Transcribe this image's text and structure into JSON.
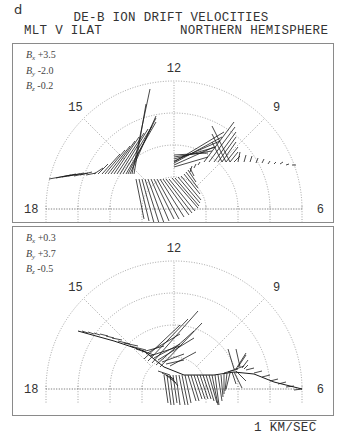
{
  "figure": {
    "letter": "d",
    "title": "DE-B ION DRIFT VELOCITIES",
    "subtitle_left": "MLT V ILAT",
    "subtitle_right": "NORTHERN HEMISPHERE",
    "scale_label_number": "1",
    "scale_label_unit": "KM/SEC"
  },
  "chart_data": [
    {
      "type": "polar-vector",
      "title": "DE-B ION DRIFT VELOCITIES (panel 1)",
      "coordinates": "MLT vs invariant latitude, northern hemisphere, dial-plot (upper half)",
      "imf": {
        "Bx": "+3.5",
        "By": "-2.0",
        "Bz": "-0.2"
      },
      "mlt_labels": [
        "18",
        "15",
        "12",
        "9",
        "6"
      ],
      "rings": 4,
      "grid": "dotted",
      "scale": "1 KM/SEC",
      "description": "Dusk-side antisunward/sunward flow along track from 18 MLT through 15 to near pole, strong flows near 14-16 MLT; dawn-side fan of vectors between 9 and 11 MLT"
    },
    {
      "type": "polar-vector",
      "title": "DE-B ION DRIFT VELOCITIES (panel 2)",
      "coordinates": "MLT vs invariant latitude, northern hemisphere, dial-plot (upper half)",
      "imf": {
        "Bx": "+0.3",
        "By": "+3.7",
        "Bz": "-0.5"
      },
      "mlt_labels": [
        "18",
        "15",
        "12",
        "9",
        "6"
      ],
      "rings": 4,
      "grid": "dotted",
      "scale": "1 KM/SEC",
      "description": "Track from ~16 MLT across polar cap toward 6 MLT; large vectors near noon sector and lower latitude flows near 7-8 MLT"
    }
  ],
  "panels": [
    {
      "imf": [
        {
          "label": "B",
          "sub": "x",
          "value": "+3.5"
        },
        {
          "label": "B",
          "sub": "y",
          "value": "-2.0"
        },
        {
          "label": "B",
          "sub": "z",
          "value": "-0.2"
        }
      ],
      "labels": {
        "h18": "18",
        "h15": "15",
        "h12": "12",
        "h9": "9",
        "h6": "6"
      },
      "center": [
        161,
        165
      ],
      "radii": [
        32,
        64,
        96,
        128
      ],
      "vectors": [
        [
          -125,
          -30,
          22,
          -4
        ],
        [
          -118,
          -31,
          20,
          -4
        ],
        [
          -112,
          -32,
          18,
          -3
        ],
        [
          -106,
          -33,
          16,
          -3
        ],
        [
          -100,
          -33,
          14,
          -3
        ],
        [
          -94,
          -34,
          12,
          -3
        ],
        [
          -88,
          -34,
          10,
          -2
        ],
        [
          -80,
          -35,
          9,
          -6
        ],
        [
          -76,
          -35,
          10,
          -10
        ],
        [
          -72,
          -35,
          18,
          -20
        ],
        [
          -69,
          -35,
          20,
          -24
        ],
        [
          -66,
          -35,
          22,
          -28
        ],
        [
          -63,
          -35,
          24,
          -33
        ],
        [
          -60,
          -35,
          25,
          -37
        ],
        [
          -57,
          -35,
          27,
          -41
        ],
        [
          -54,
          -35,
          28,
          -45
        ],
        [
          -51,
          -35,
          29,
          -48
        ],
        [
          -48,
          -35,
          30,
          -52
        ],
        [
          -46,
          -35,
          28,
          -56
        ],
        [
          -44,
          -35,
          26,
          -58
        ],
        [
          -42,
          -35,
          18,
          -85
        ],
        [
          -40,
          -35,
          12,
          -70
        ],
        [
          -38,
          -30,
          8,
          40
        ],
        [
          -35,
          -30,
          10,
          42
        ],
        [
          -32,
          -30,
          12,
          44
        ],
        [
          -29,
          -30,
          14,
          44
        ],
        [
          -26,
          -30,
          16,
          44
        ],
        [
          -23,
          -30,
          18,
          42
        ],
        [
          -20,
          -30,
          20,
          40
        ],
        [
          -17,
          -30,
          22,
          40
        ],
        [
          -14,
          -30,
          24,
          38
        ],
        [
          -11,
          -30,
          26,
          36
        ],
        [
          -8,
          -30,
          26,
          34
        ],
        [
          -5,
          -30,
          26,
          32
        ],
        [
          -2,
          -31,
          26,
          30
        ],
        [
          1,
          -31,
          24,
          28
        ],
        [
          4,
          -32,
          22,
          26
        ],
        [
          7,
          -33,
          20,
          24
        ],
        [
          10,
          -35,
          16,
          20
        ],
        [
          12,
          -37,
          12,
          16
        ],
        [
          14,
          -39,
          8,
          12
        ],
        [
          16,
          -41,
          4,
          8
        ],
        [
          18,
          -43,
          -2,
          6
        ],
        [
          22,
          -45,
          -2,
          4
        ],
        [
          26,
          -47,
          -2,
          3
        ],
        [
          0,
          -47,
          50,
          -30
        ],
        [
          0,
          -48,
          46,
          -20
        ],
        [
          0,
          -50,
          42,
          -12
        ],
        [
          0,
          -52,
          38,
          -6
        ],
        [
          0,
          -54,
          34,
          -2
        ],
        [
          0,
          -46,
          48,
          -26
        ],
        [
          0,
          -44,
          40,
          -18
        ],
        [
          0,
          -42,
          34,
          -10
        ],
        [
          30,
          -47,
          30,
          -40
        ],
        [
          35,
          -47,
          26,
          -35
        ],
        [
          40,
          -47,
          22,
          -30
        ],
        [
          44,
          -47,
          18,
          -25
        ],
        [
          48,
          -47,
          14,
          -20
        ],
        [
          52,
          -47,
          12,
          -15
        ],
        [
          56,
          -47,
          8,
          -10
        ],
        [
          60,
          -47,
          6,
          -6
        ],
        [
          48,
          -47,
          -10,
          -20
        ],
        [
          52,
          -47,
          -14,
          -28
        ],
        [
          56,
          -47,
          -18,
          -36
        ],
        [
          64,
          -47,
          2,
          -10
        ],
        [
          70,
          -47,
          2,
          -7
        ],
        [
          76,
          -47,
          2,
          -6
        ],
        [
          82,
          -46,
          2,
          -5
        ],
        [
          88,
          -46,
          2,
          -4
        ],
        [
          94,
          -45,
          2,
          -3
        ],
        [
          100,
          -45,
          2,
          -2
        ],
        [
          106,
          -45,
          3,
          -2
        ],
        [
          112,
          -44,
          3,
          -1
        ],
        [
          118,
          -44,
          4,
          0
        ]
      ]
    },
    {
      "imf": [
        {
          "label": "B",
          "sub": "x",
          "value": "+0.3"
        },
        {
          "label": "B",
          "sub": "y",
          "value": "+3.7"
        },
        {
          "label": "B",
          "sub": "z",
          "value": "-0.5"
        }
      ],
      "labels": {
        "h18": "18",
        "h15": "15",
        "h12": "12",
        "h9": "9",
        "h6": "6"
      },
      "center": [
        161,
        162
      ],
      "radii": [
        32,
        64,
        96,
        128
      ],
      "vectors": [
        [
          -92,
          -58,
          6,
          2
        ],
        [
          -86,
          -57,
          6,
          2
        ],
        [
          -80,
          -56,
          6,
          2
        ],
        [
          -74,
          -55,
          8,
          2
        ],
        [
          -68,
          -53,
          8,
          2
        ],
        [
          -62,
          -51,
          10,
          2
        ],
        [
          -56,
          -48,
          12,
          3
        ],
        [
          -50,
          -46,
          14,
          3
        ],
        [
          -44,
          -43,
          16,
          4
        ],
        [
          -38,
          -40,
          18,
          6
        ],
        [
          -32,
          -37,
          22,
          -6
        ],
        [
          -28,
          -35,
          34,
          -20
        ],
        [
          -24,
          -33,
          30,
          -10
        ],
        [
          -20,
          -31,
          26,
          -14
        ],
        [
          -16,
          -29,
          36,
          -22
        ],
        [
          -12,
          -27,
          22,
          -8
        ],
        [
          -8,
          -25,
          18,
          -4
        ],
        [
          -4,
          -23,
          26,
          -14
        ],
        [
          -30,
          -30,
          36,
          -34
        ],
        [
          -26,
          -28,
          40,
          -42
        ],
        [
          -22,
          -26,
          46,
          -52
        ],
        [
          -18,
          -24,
          38,
          -34
        ],
        [
          -14,
          -22,
          42,
          -44
        ],
        [
          -16,
          -18,
          12,
          4
        ],
        [
          -12,
          -16,
          12,
          6
        ],
        [
          -8,
          -14,
          10,
          8
        ],
        [
          -4,
          -13,
          8,
          10
        ],
        [
          -10,
          -14,
          4,
          28
        ],
        [
          -7,
          -14,
          4,
          30
        ],
        [
          -4,
          -14,
          4,
          30
        ],
        [
          -1,
          -14,
          4,
          28
        ],
        [
          2,
          -14,
          4,
          30
        ],
        [
          5,
          -14,
          6,
          30
        ],
        [
          8,
          -14,
          6,
          30
        ],
        [
          11,
          -14,
          6,
          28
        ],
        [
          14,
          -14,
          8,
          26
        ],
        [
          17,
          -14,
          8,
          26
        ],
        [
          20,
          -14,
          8,
          24
        ],
        [
          23,
          -14,
          8,
          24
        ],
        [
          26,
          -14,
          8,
          24
        ],
        [
          29,
          -14,
          8,
          24
        ],
        [
          32,
          -14,
          8,
          26
        ],
        [
          35,
          -14,
          8,
          28
        ],
        [
          38,
          -14,
          6,
          30
        ],
        [
          41,
          -14,
          4,
          30
        ],
        [
          44,
          -14,
          4,
          26
        ],
        [
          47,
          -14,
          2,
          22
        ],
        [
          50,
          -15,
          0,
          20
        ],
        [
          53,
          -16,
          -2,
          18
        ],
        [
          56,
          -16,
          -4,
          16
        ],
        [
          58,
          -17,
          4,
          12
        ],
        [
          60,
          -17,
          8,
          16
        ],
        [
          62,
          -18,
          10,
          10
        ],
        [
          50,
          -16,
          14,
          -4
        ],
        [
          54,
          -17,
          16,
          -6
        ],
        [
          60,
          -20,
          -6,
          -20
        ],
        [
          62,
          -20,
          10,
          -16
        ],
        [
          64,
          -22,
          8,
          -12
        ],
        [
          66,
          -22,
          -4,
          -18
        ],
        [
          68,
          -21,
          6,
          -8
        ],
        [
          70,
          -20,
          4,
          -4
        ],
        [
          72,
          -19,
          8,
          -2
        ],
        [
          80,
          -16,
          8,
          -2
        ],
        [
          88,
          -12,
          8,
          -2
        ],
        [
          96,
          -8,
          8,
          -2
        ],
        [
          104,
          -5,
          8,
          -2
        ],
        [
          112,
          -2,
          8,
          -1
        ],
        [
          120,
          1,
          8,
          -1
        ]
      ],
      "polyline": [
        [
          -96,
          -58
        ],
        [
          -60,
          -48
        ],
        [
          -30,
          -38
        ],
        [
          -10,
          -22
        ],
        [
          10,
          -14
        ],
        [
          40,
          -14
        ],
        [
          60,
          -17
        ],
        [
          80,
          -15
        ],
        [
          100,
          -7
        ],
        [
          128,
          0
        ]
      ]
    }
  ]
}
